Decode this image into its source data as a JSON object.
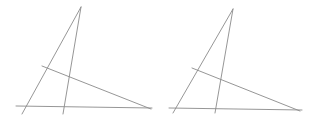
{
  "diagram": {
    "stroke_color": "#8a8a8a",
    "background": "#ffffff",
    "figures": [
      {
        "name": "left-figure",
        "lines": [
          {
            "name": "side-left",
            "x1": 81,
            "y1": 7,
            "x2": 22,
            "y2": 114
          },
          {
            "name": "cevian",
            "x1": 81,
            "y1": 7,
            "x2": 63,
            "y2": 114
          },
          {
            "name": "baseline",
            "x1": 16,
            "y1": 106,
            "x2": 152,
            "y2": 108
          },
          {
            "name": "transversal",
            "x1": 42,
            "y1": 66,
            "x2": 151,
            "y2": 109
          }
        ]
      },
      {
        "name": "right-figure",
        "lines": [
          {
            "name": "side-left",
            "x1": 233,
            "y1": 9,
            "x2": 173,
            "y2": 113
          },
          {
            "name": "cevian",
            "x1": 233,
            "y1": 9,
            "x2": 215,
            "y2": 113
          },
          {
            "name": "baseline",
            "x1": 169,
            "y1": 108,
            "x2": 302,
            "y2": 110
          },
          {
            "name": "transversal",
            "x1": 192,
            "y1": 68,
            "x2": 300,
            "y2": 111
          }
        ]
      }
    ]
  }
}
